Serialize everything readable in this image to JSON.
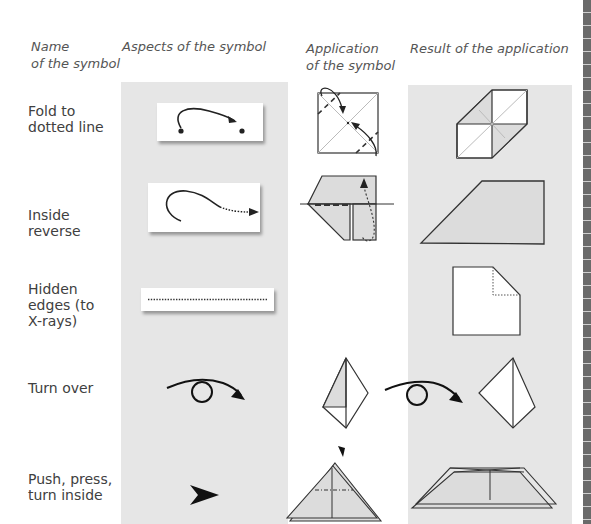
{
  "headers": {
    "name": [
      "Name",
      "of the symbol"
    ],
    "aspects": "Aspects of the symbol",
    "application": [
      "Application",
      "of the symbol"
    ],
    "result": "Result of the application"
  },
  "rows": [
    {
      "name": [
        "Fold to",
        "dotted line"
      ],
      "symbol": "fold-arrow-between-dots"
    },
    {
      "name": [
        "Inside",
        "reverse"
      ],
      "symbol": "curved-arrow-dotted-tail"
    },
    {
      "name": [
        "Hidden",
        "edges (to",
        "X-rays)"
      ],
      "symbol": "dotted-line"
    },
    {
      "name": [
        "Turn over"
      ],
      "symbol": "turn-over-loop-arrow"
    },
    {
      "name": [
        "Push, press,",
        "turn inside"
      ],
      "symbol": "push-arrowhead"
    }
  ],
  "colors": {
    "column_background": "#e6e6e6",
    "paper_fill": "#dcdcdc",
    "line": "#333333",
    "edge_strip": "#6a6a6a"
  }
}
